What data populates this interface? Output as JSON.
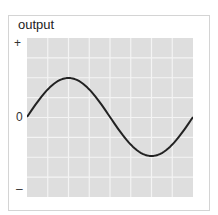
{
  "figure": {
    "title": "output",
    "y_ticks": {
      "top": "+",
      "middle": "0",
      "bottom": "–"
    },
    "colors": {
      "plot_bg": "#dedede",
      "grid": "#f4f4f4",
      "curve": "#222222",
      "border": "#d4d4d4"
    }
  },
  "chart_data": {
    "type": "line",
    "title": "output",
    "xlabel": "",
    "ylabel": "output",
    "y_tick_labels": [
      "+",
      "0",
      "–"
    ],
    "x": [
      0,
      0.125,
      0.25,
      0.375,
      0.5,
      0.625,
      0.75,
      0.875,
      1.0
    ],
    "series": [
      {
        "name": "output",
        "values": [
          0,
          0.35,
          0.5,
          0.35,
          0,
          -0.35,
          -0.5,
          -0.35,
          0
        ]
      }
    ],
    "ylim": [
      -1,
      1
    ],
    "grid": true,
    "grid_cols": 8,
    "grid_rows": 8
  }
}
